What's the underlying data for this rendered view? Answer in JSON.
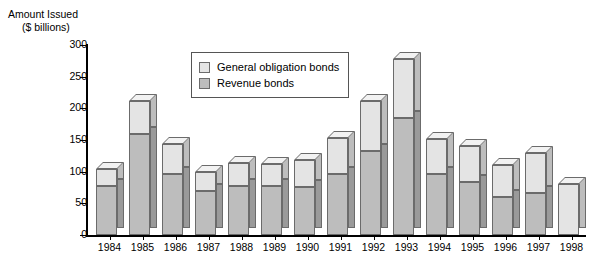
{
  "chart_data": {
    "type": "bar",
    "stacked": true,
    "title": "",
    "subtitle": "",
    "ylabel_line1": "Amount Issued",
    "ylabel_line2": "($ billions)",
    "xlabel": "",
    "ylim": [
      0,
      300
    ],
    "ytick_step": 50,
    "yticks": [
      0,
      50,
      100,
      150,
      200,
      250,
      300
    ],
    "ytick_labels": [
      "0",
      "50",
      "100",
      "150",
      "200",
      "250",
      "300"
    ],
    "grid": false,
    "legend_position": "inside-top-center",
    "categories": [
      "1984",
      "1985",
      "1986",
      "1987",
      "1988",
      "1989",
      "1990",
      "1991",
      "1992",
      "1993",
      "1994",
      "1995",
      "1996",
      "1997",
      "1998"
    ],
    "series": [
      {
        "name": "Revenue bonds",
        "color": "#bdbdbd",
        "values": [
          78,
          160,
          97,
          70,
          78,
          77,
          76,
          96,
          132,
          185,
          97,
          84,
          60,
          66,
          null
        ]
      },
      {
        "name": "General obligation bonds",
        "color": "#e4e4e4",
        "values": [
          27,
          52,
          46,
          29,
          35,
          35,
          43,
          57,
          80,
          93,
          55,
          56,
          50,
          64,
          80
        ]
      }
    ],
    "totals": [
      105,
      212,
      143,
      99,
      113,
      112,
      119,
      153,
      212,
      278,
      152,
      140,
      110,
      130,
      80
    ]
  },
  "legend": {
    "items": [
      {
        "label": "General obligation bonds",
        "swatch": "#e4e4e4"
      },
      {
        "label": "Revenue bonds",
        "swatch": "#bdbdbd"
      }
    ]
  },
  "colors": {
    "general_obligation": "#e4e4e4",
    "revenue": "#bdbdbd",
    "side_general_obligation": "#bdbdbd",
    "side_revenue": "#9a9a9a",
    "top_face": "#f2f2f2",
    "outline": "#6b6b6b",
    "axis": "#000000",
    "background": "#ffffff"
  }
}
